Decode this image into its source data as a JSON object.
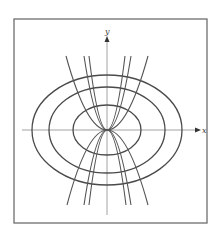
{
  "figure": {
    "axes": {
      "x_label": "x",
      "y_label": "y"
    },
    "colors": {
      "frame": "#6e6e6e",
      "curves": "#4a4a4a",
      "axis": "#8a8a8a"
    },
    "ellipses": [
      {
        "name": "inner",
        "rx": 34,
        "ry": 25
      },
      {
        "name": "middle",
        "rx": 58,
        "ry": 43
      },
      {
        "name": "outer",
        "rx": 75,
        "ry": 55
      }
    ],
    "parabolas": [
      {
        "name": "narrow",
        "half_width_at_edge": 19
      },
      {
        "name": "medium",
        "half_width_at_edge": 24
      },
      {
        "name": "wide",
        "half_width_at_edge": 41
      }
    ]
  }
}
